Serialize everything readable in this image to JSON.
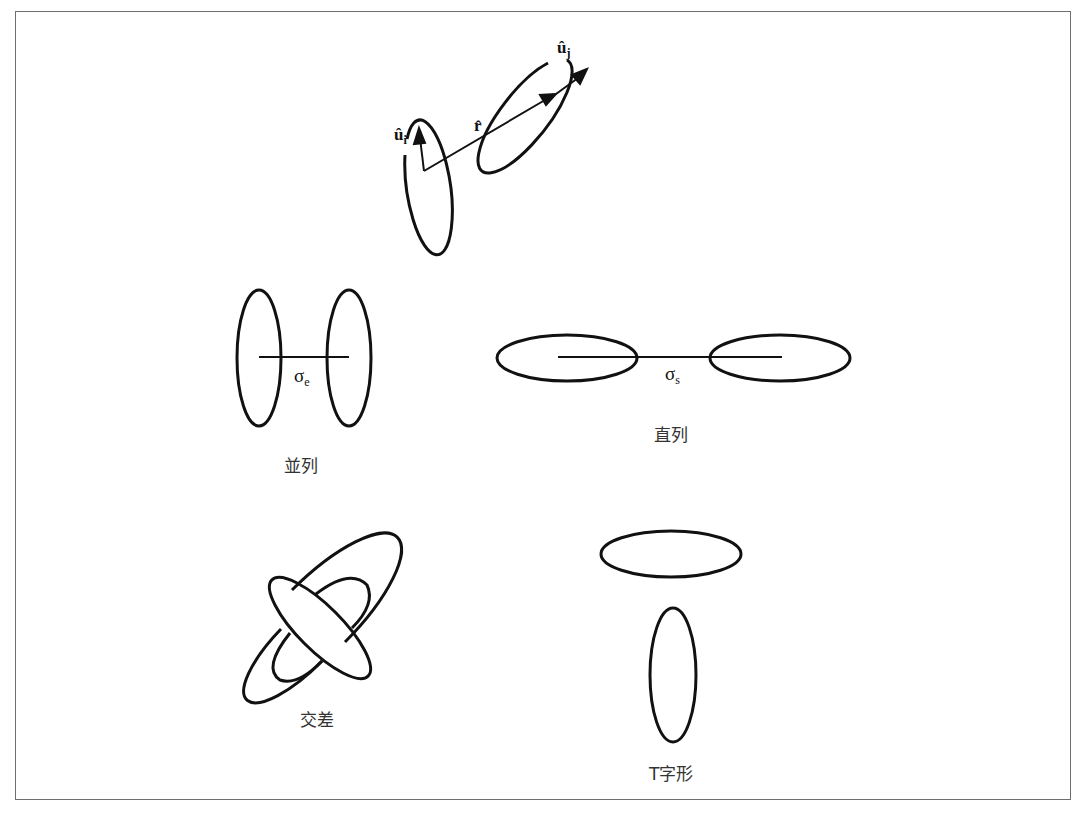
{
  "figure": {
    "top": {
      "label_ui": "û",
      "label_ui_sub": "i",
      "label_uj": "û",
      "label_uj_sub": "j",
      "label_r": "r̂"
    },
    "parallel": {
      "caption": "並列",
      "sigma": "σ",
      "sigma_sub": "e"
    },
    "series": {
      "caption": "直列",
      "sigma": "σ",
      "sigma_sub": "s"
    },
    "crossed": {
      "caption": "交差"
    },
    "tshape": {
      "caption": "T字形"
    },
    "colors": {
      "stroke": "#111111",
      "frame": "#6e6e6e",
      "background": "#ffffff"
    }
  }
}
